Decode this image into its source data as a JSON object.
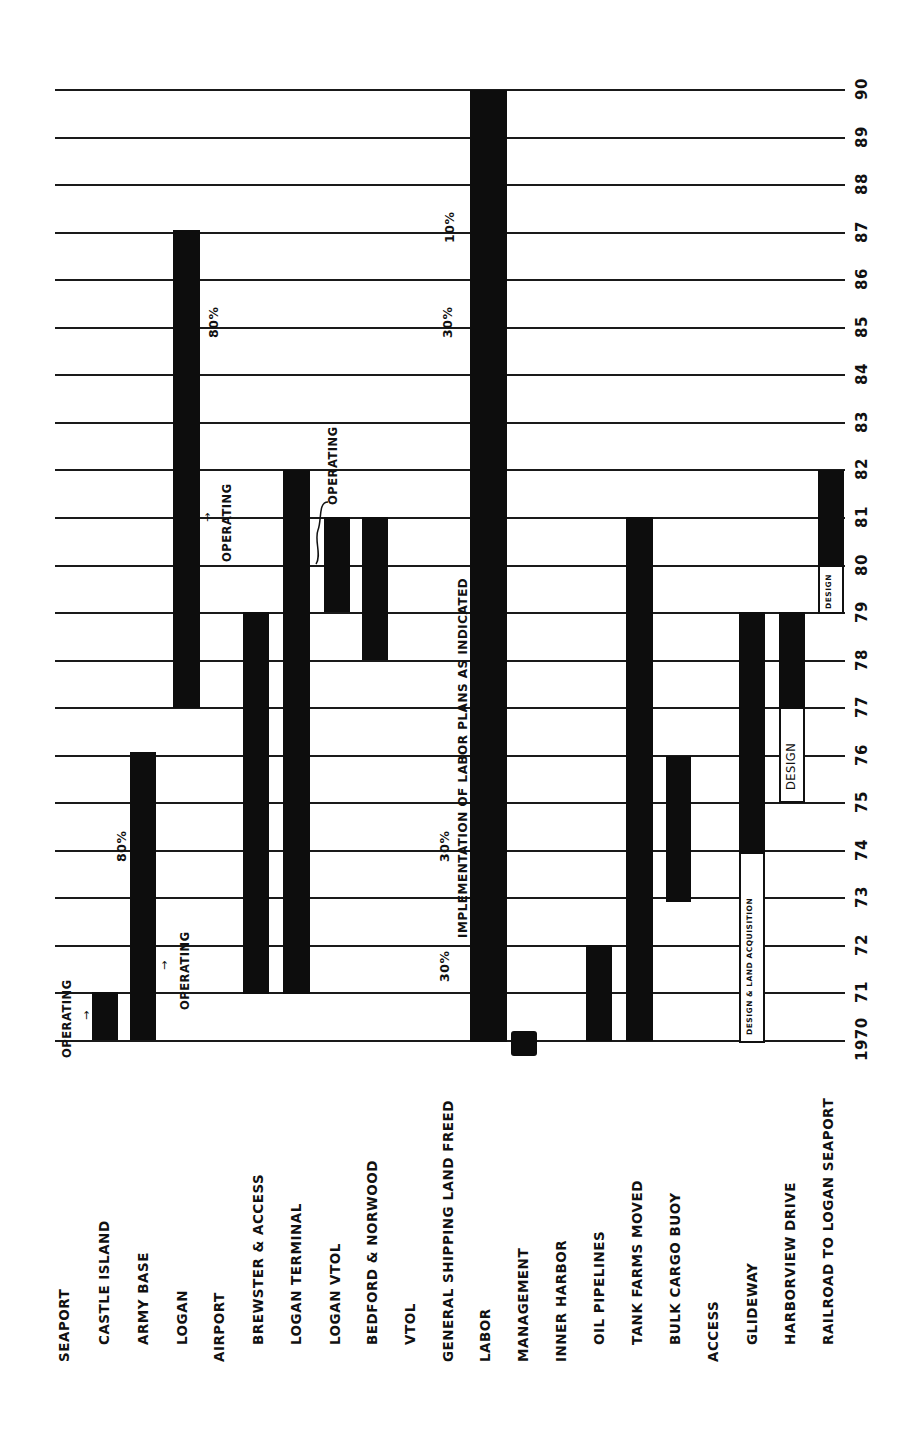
{
  "chart_data": {
    "type": "gantt",
    "orientation": "rotated 90deg counter-clockwise (years increase upward, categories read left-to-right)",
    "title": "",
    "xlabel": "",
    "ylabel": "Year",
    "year_range": [
      1970,
      1990
    ],
    "year_ticks": [
      "1970",
      "71",
      "72",
      "73",
      "74",
      "75",
      "76",
      "77",
      "78",
      "79",
      "80",
      "81",
      "82",
      "83",
      "84",
      "85",
      "86",
      "87",
      "88",
      "89",
      "90"
    ],
    "grid": true,
    "categories": [
      {
        "label": "SEAPORT",
        "level": 0
      },
      {
        "label": "CASTLE ISLAND",
        "level": 1
      },
      {
        "label": "ARMY BASE",
        "level": 1
      },
      {
        "label": "LOGAN",
        "level": 1
      },
      {
        "label": "AIRPORT",
        "level": 0
      },
      {
        "label": "BREWSTER & ACCESS",
        "level": 1
      },
      {
        "label": "LOGAN TERMINAL",
        "level": 1
      },
      {
        "label": "LOGAN VTOL",
        "level": 1
      },
      {
        "label": "BEDFORD & NORWOOD",
        "level": 1
      },
      {
        "label": "VTOL",
        "level": 1
      },
      {
        "label": "GENERAL SHIPPING LAND FREED",
        "level": 0
      },
      {
        "label": "LABOR",
        "level": 0
      },
      {
        "label": "MANAGEMENT",
        "level": 0
      },
      {
        "label": "INNER HARBOR",
        "level": 0
      },
      {
        "label": "OIL PIPELINES",
        "level": 1
      },
      {
        "label": "TANK FARMS MOVED",
        "level": 1
      },
      {
        "label": "BULK CARGO BUOY",
        "level": 1
      },
      {
        "label": "ACCESS",
        "level": 0
      },
      {
        "label": "GLIDEWAY",
        "level": 1
      },
      {
        "label": "HARBORVIEW DRIVE",
        "level": 1
      },
      {
        "label": "RAILROAD TO LOGAN SEAPORT",
        "level": 1
      }
    ],
    "tasks": [
      {
        "category": "CASTLE ISLAND",
        "phases": [
          {
            "type": "active",
            "start": 1970,
            "end": 1971
          }
        ]
      },
      {
        "category": "ARMY BASE",
        "phases": [
          {
            "type": "active",
            "start": 1970,
            "end": 1976
          }
        ]
      },
      {
        "category": "LOGAN",
        "phases": [
          {
            "type": "active",
            "start": 1977,
            "end": 1987
          }
        ]
      },
      {
        "category": "BREWSTER & ACCESS",
        "phases": [
          {
            "type": "active",
            "start": 1971,
            "end": 1979
          }
        ]
      },
      {
        "category": "LOGAN TERMINAL",
        "phases": [
          {
            "type": "active",
            "start": 1971,
            "end": 1982
          }
        ]
      },
      {
        "category": "LOGAN VTOL",
        "phases": [
          {
            "type": "active",
            "start": 1979,
            "end": 1981
          }
        ]
      },
      {
        "category": "BEDFORD & NORWOOD",
        "phases": [
          {
            "type": "active",
            "start": 1978,
            "end": 1981
          }
        ]
      },
      {
        "category": "LABOR",
        "phases": [
          {
            "type": "active",
            "start": 1970,
            "end": 1990
          }
        ]
      },
      {
        "category": "MANAGEMENT",
        "phases": [
          {
            "type": "milestone",
            "start": 1970,
            "end": 1970
          }
        ]
      },
      {
        "category": "OIL PIPELINES",
        "phases": [
          {
            "type": "active",
            "start": 1970,
            "end": 1972
          }
        ]
      },
      {
        "category": "TANK FARMS MOVED",
        "phases": [
          {
            "type": "active",
            "start": 1970,
            "end": 1981
          }
        ]
      },
      {
        "category": "BULK CARGO BUOY",
        "phases": [
          {
            "type": "active",
            "start": 1973,
            "end": 1976
          }
        ]
      },
      {
        "category": "GLIDEWAY",
        "phases": [
          {
            "type": "design",
            "label": "DESIGN & LAND ACQUISITION",
            "start": 1970,
            "end": 1974
          },
          {
            "type": "active",
            "start": 1974,
            "end": 1979
          }
        ]
      },
      {
        "category": "HARBORVIEW DRIVE",
        "phases": [
          {
            "type": "design",
            "label": "DESIGN",
            "start": 1975,
            "end": 1977
          },
          {
            "type": "active",
            "start": 1977,
            "end": 1979
          }
        ]
      },
      {
        "category": "RAILROAD TO LOGAN SEAPORT",
        "phases": [
          {
            "type": "design",
            "label": "DESIGN",
            "start": 1979,
            "end": 1980
          },
          {
            "type": "active",
            "start": 1980,
            "end": 1982
          }
        ]
      }
    ],
    "annotations": [
      {
        "text": "OPERATING",
        "target": "CASTLE ISLAND",
        "year": 1970.5
      },
      {
        "text": "OPERATING",
        "target": "ARMY BASE",
        "year": 1971.5
      },
      {
        "text": "80%",
        "target": "ARMY BASE",
        "year": 1974.5
      },
      {
        "text": "OPERATING",
        "target": "LOGAN",
        "year": 1981
      },
      {
        "text": "80%",
        "target": "LOGAN",
        "year": 1985.5
      },
      {
        "text": "OPERATING",
        "target": "LOGAN VTOL",
        "year": 1982
      },
      {
        "text": "30%",
        "target": "GENERAL SHIPPING LAND FREED",
        "year": 1971.5
      },
      {
        "text": "30%",
        "target": "GENERAL SHIPPING LAND FREED",
        "year": 1974
      },
      {
        "text": "30%",
        "target": "GENERAL SHIPPING LAND FREED",
        "year": 1985.5
      },
      {
        "text": "10%",
        "target": "GENERAL SHIPPING LAND FREED",
        "year": 1987.5
      },
      {
        "text": "IMPLEMENTATION OF LABOR PLANS AS INDICATED",
        "target": "LABOR",
        "span": [
          1972,
          1981
        ]
      }
    ]
  },
  "labels": {
    "years": [
      "1970",
      "71",
      "72",
      "73",
      "74",
      "75",
      "76",
      "77",
      "78",
      "79",
      "80",
      "81",
      "82",
      "83",
      "84",
      "85",
      "86",
      "87",
      "88",
      "89",
      "90"
    ],
    "categories": [
      "SEAPORT",
      "CASTLE ISLAND",
      "ARMY BASE",
      "LOGAN",
      "AIRPORT",
      "BREWSTER & ACCESS",
      "LOGAN TERMINAL",
      "LOGAN VTOL",
      "BEDFORD & NORWOOD",
      "VTOL",
      "GENERAL SHIPPING LAND FREED",
      "LABOR",
      "MANAGEMENT",
      "INNER HARBOR",
      "OIL PIPELINES",
      "TANK FARMS MOVED",
      "BULK CARGO BUOY",
      "ACCESS",
      "GLIDEWAY",
      "HARBORVIEW DRIVE",
      "RAILROAD TO LOGAN SEAPORT"
    ],
    "operating": "OPERATING",
    "pct_80": "80%",
    "pct_30": "30%",
    "pct_10": "10%",
    "labor_note": "IMPLEMENTATION OF LABOR PLANS AS INDICATED",
    "design_land": "DESIGN & LAND ACQUISITION",
    "design": "DESIGN"
  },
  "colors": {
    "bar": "#0d0d0d",
    "grid": "#1a1a1a",
    "background": "#ffffff"
  }
}
